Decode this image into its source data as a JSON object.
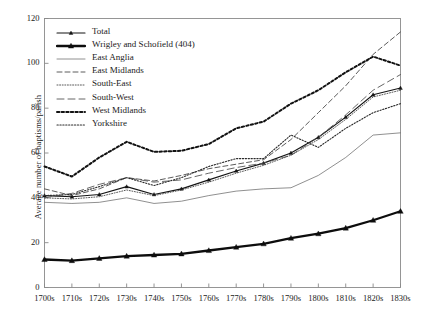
{
  "chart_data": {
    "type": "line",
    "title": "",
    "xlabel": "",
    "ylabel": "Average number of baptisms/parish",
    "ylim": [
      0,
      120
    ],
    "ytick_values": [
      0,
      20,
      40,
      60,
      80,
      100,
      120
    ],
    "ytick_labels": [
      "0",
      "20",
      "40",
      "60",
      "80",
      "100",
      "120"
    ],
    "grid": false,
    "legend_position": "upper-left-inside",
    "categories": [
      "1700s",
      "1710s",
      "1720s",
      "1730s",
      "1740s",
      "1750s",
      "1760s",
      "1770s",
      "1780s",
      "1790s",
      "1800s",
      "1810s",
      "1820s",
      "1830s"
    ],
    "series": [
      {
        "name": "Total",
        "style": "solid-marker",
        "color": "#141414",
        "values": [
          41,
          40.5,
          41.5,
          45,
          41.5,
          44,
          48,
          52,
          55.5,
          60,
          67,
          76,
          86,
          89
        ]
      },
      {
        "name": "Wrigley and Schofield (404)",
        "style": "thick-solid-marker",
        "color": "#0d0d0d",
        "values": [
          12.5,
          12,
          13,
          14,
          14.5,
          15,
          16.5,
          18,
          19.5,
          22,
          24,
          26.5,
          30,
          34
        ]
      },
      {
        "name": "East Anglia",
        "style": "thin-solid",
        "color": "#6b6b6b",
        "values": [
          38,
          37.5,
          38,
          40,
          37.5,
          38.5,
          41,
          43,
          44,
          44.5,
          50,
          58,
          68,
          69
        ]
      },
      {
        "name": "East Midlands",
        "style": "dashed",
        "color": "#4a4a4a",
        "values": [
          44,
          41,
          44,
          49,
          47.5,
          50,
          53,
          55,
          57,
          66,
          78,
          90,
          104,
          114
        ]
      },
      {
        "name": "South-East",
        "style": "fine-dotted",
        "color": "#3d3d3d",
        "values": [
          40,
          39.5,
          40.5,
          43.5,
          41,
          43.5,
          47,
          51,
          54.5,
          59,
          66,
          75,
          85,
          88
        ]
      },
      {
        "name": "South-West",
        "style": "long-dashed",
        "color": "#555555",
        "values": [
          40,
          42,
          46,
          49,
          47,
          48,
          51,
          53.5,
          55.5,
          59,
          67,
          77,
          88,
          95
        ]
      },
      {
        "name": "West Midlands",
        "style": "bold-dotted",
        "color": "#121212",
        "values": [
          54,
          49.5,
          58,
          65,
          60.5,
          61,
          64,
          71,
          74,
          82,
          88,
          96,
          103,
          99
        ]
      },
      {
        "name": "Yorkshire",
        "style": "dotted",
        "color": "#2b2b2b",
        "values": [
          41,
          41.5,
          45,
          49,
          45.5,
          49,
          54,
          57.5,
          57.5,
          68,
          62.5,
          71,
          78,
          82
        ]
      }
    ]
  },
  "legend": {
    "items": [
      {
        "label": "Total"
      },
      {
        "label": "Wrigley and Schofield (404)"
      },
      {
        "label": "East Anglia"
      },
      {
        "label": "East Midlands"
      },
      {
        "label": "South-East"
      },
      {
        "label": "South-West"
      },
      {
        "label": "West Midlands"
      },
      {
        "label": "Yorkshire"
      }
    ]
  },
  "axes": {
    "frame_color": "#8a8a8a",
    "text_color": "#1a1a1a"
  }
}
